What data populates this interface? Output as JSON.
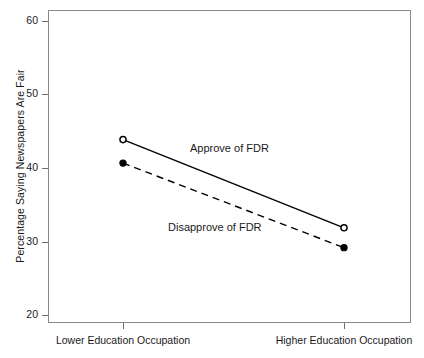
{
  "chart_data": {
    "type": "line",
    "title": "",
    "subtitle": "",
    "xlabel": "",
    "ylabel": "Percentage Saying Newspapers Are Fair",
    "categories": [
      "Lower Education Occupation",
      "Higher Education Occupation"
    ],
    "x": [
      0,
      1
    ],
    "xlim": [
      -0.33,
      1.33
    ],
    "ylim": [
      20,
      61.6
    ],
    "yticks": [
      20,
      30,
      40,
      50,
      60
    ],
    "ytick_labels": [
      "20",
      "30",
      "40",
      "50",
      "60"
    ],
    "xtick_labels": [
      "Lower Education Occupation",
      "Higher Education Occupation"
    ],
    "grid": false,
    "legend_position": "inline-annotations",
    "series": [
      {
        "name": "Approve of FDR",
        "values": [
          44.0,
          32.0
        ],
        "line_style": "solid",
        "marker": "open-circle",
        "color": "#000000",
        "annotation": "Approve of FDR"
      },
      {
        "name": "Disapprove of FDR",
        "values": [
          40.8,
          29.3
        ],
        "line_style": "dashed",
        "marker": "filled-circle",
        "color": "#000000",
        "annotation": "Disapprove of FDR"
      }
    ],
    "annotations": [
      "Approve of FDR",
      "Disapprove of FDR"
    ]
  },
  "axes": {
    "y_title": "Percentage Saying Newspapers Are Fair",
    "y_ticks": [
      {
        "label": "60",
        "value": 60
      },
      {
        "label": "50",
        "value": 50
      },
      {
        "label": "40",
        "value": 40
      },
      {
        "label": "30",
        "value": 30
      },
      {
        "label": "20",
        "value": 20
      }
    ],
    "x_ticks": [
      {
        "label": "Lower Education Occupation",
        "value": 0
      },
      {
        "label": "Higher Education Occupation",
        "value": 1
      }
    ]
  },
  "colors": {
    "frame": "#8a8a8a",
    "ink": "#1a1a1a",
    "series": "#000000",
    "background": "#ffffff"
  }
}
